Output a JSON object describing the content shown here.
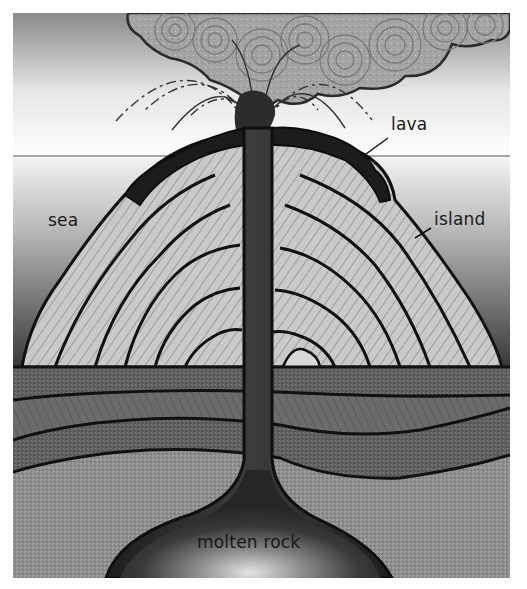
{
  "diagram": {
    "labels": {
      "lava": "lava",
      "sea": "sea",
      "island": "island",
      "molten_rock": "molten rock"
    },
    "parts": [
      "ash-cloud",
      "ejecta-arcs",
      "vent",
      "lava-cap",
      "island-strata",
      "sea",
      "sky",
      "sediment-layers",
      "conduit",
      "magma-chamber"
    ],
    "colors": {
      "sky_top": "#8c8c8c",
      "sky_bottom": "#ffffff",
      "sea_top": "#f2f2f2",
      "sea_bottom": "#3a3a3a",
      "outline": "#111111",
      "lava": "#1c1c1c",
      "strata_light": "#c8c8c8",
      "strata_mid": "#9a9a9a",
      "sediment_dark": "#5a5a5a",
      "sediment_mid": "#6e6e6e",
      "bedrock": "#8f8f8f",
      "magma": "#2a2a2a",
      "magma_glow": "#d8d8d8"
    }
  }
}
